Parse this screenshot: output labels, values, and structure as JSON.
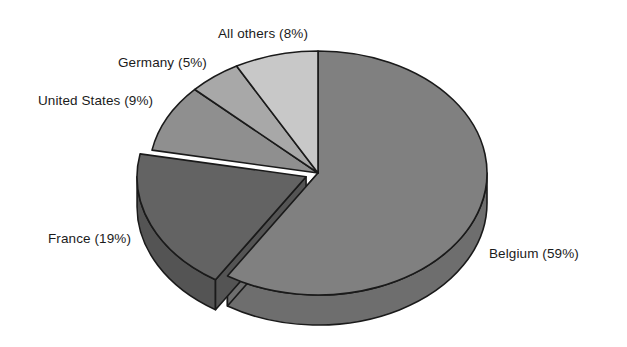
{
  "chart_data": {
    "type": "pie",
    "title": "",
    "subtitle": "",
    "xlabel": "",
    "ylabel": "",
    "legend_position": "none",
    "grid": false,
    "three_d": true,
    "exploded_slice": "France (19%)",
    "start_angle_deg": 0,
    "direction": "clockwise",
    "units": "percent",
    "categories": [
      "Belgium",
      "France",
      "United States",
      "Germany",
      "All others"
    ],
    "values": [
      59,
      19,
      9,
      5,
      8
    ],
    "labels": [
      "Belgium (59%)",
      "France (19%)",
      "United States (9%)",
      "Germany (5%)",
      "All others (8%)"
    ],
    "slices": [
      {
        "name": "Belgium",
        "value": 59,
        "label": "Belgium (59%)",
        "color": "#808080",
        "side_color": "#6e6e6e"
      },
      {
        "name": "France",
        "value": 19,
        "label": "France (19%)",
        "color": "#636363",
        "side_color": "#545454"
      },
      {
        "name": "United States",
        "value": 9,
        "label": "United States (9%)",
        "color": "#8f8f8f",
        "side_color": "#7b7b7b"
      },
      {
        "name": "Germany",
        "value": 5,
        "label": "Germany (5%)",
        "color": "#a8a8a8",
        "side_color": "#919191"
      },
      {
        "name": "All others",
        "value": 8,
        "label": "All others (8%)",
        "color": "#c8c8c8",
        "side_color": "#adadad"
      }
    ]
  },
  "colors": {
    "background": "#ffffff",
    "outline": "#1a1a1a",
    "text": "#1b1b1b"
  },
  "labels": {
    "all_others": "All others (8%)",
    "germany": "Germany (5%)",
    "united_states": "United States (9%)",
    "france": "France (19%)",
    "belgium": "Belgium (59%)"
  }
}
